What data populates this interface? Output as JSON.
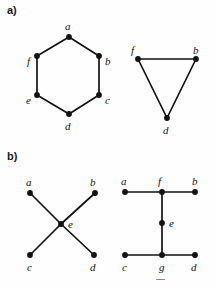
{
  "figure": {
    "background_color": "#fefefe",
    "ink_color": "#121212",
    "parts": [
      {
        "id": "part-a",
        "label": "a)",
        "x": 7,
        "y": 5
      },
      {
        "id": "part-b",
        "label": "b)",
        "x": 7,
        "y": 151
      }
    ],
    "stray_mark": {
      "x": 156,
      "y": 279,
      "width": 9,
      "height": 1
    }
  },
  "graphs": [
    {
      "id": "hexagon",
      "name": "cycle-graph-c6",
      "part": "a)",
      "shape": "hexagon",
      "vertices": [
        {
          "id": "a",
          "label": "a",
          "x": 69,
          "y": 37,
          "label_x": 65,
          "label_y": 21
        },
        {
          "id": "b",
          "label": "b",
          "x": 99,
          "y": 56,
          "label_x": 105,
          "label_y": 56
        },
        {
          "id": "c",
          "label": "c",
          "x": 99,
          "y": 95,
          "label_x": 105,
          "label_y": 95
        },
        {
          "id": "d",
          "label": "d",
          "x": 69,
          "y": 114,
          "label_x": 65,
          "label_y": 121
        },
        {
          "id": "e",
          "label": "e",
          "x": 37,
          "y": 95,
          "label_x": 26,
          "label_y": 95
        },
        {
          "id": "f",
          "label": "f",
          "x": 37,
          "y": 56,
          "label_x": 27,
          "label_y": 56
        }
      ],
      "edges": [
        [
          "a",
          "b"
        ],
        [
          "b",
          "c"
        ],
        [
          "c",
          "d"
        ],
        [
          "d",
          "e"
        ],
        [
          "e",
          "f"
        ],
        [
          "f",
          "a"
        ]
      ]
    },
    {
      "id": "triangle",
      "name": "triangle-graph-k3",
      "part": "a)",
      "shape": "triangle",
      "vertices": [
        {
          "id": "f",
          "label": "f",
          "x": 138,
          "y": 59,
          "label_x": 131,
          "label_y": 45
        },
        {
          "id": "b",
          "label": "b",
          "x": 196,
          "y": 59,
          "label_x": 193,
          "label_y": 45
        },
        {
          "id": "d",
          "label": "d",
          "x": 167,
          "y": 118,
          "label_x": 163,
          "label_y": 125
        }
      ],
      "edges": [
        [
          "f",
          "b"
        ],
        [
          "b",
          "d"
        ],
        [
          "d",
          "f"
        ]
      ]
    },
    {
      "id": "star",
      "name": "star-graph-x",
      "part": "b)",
      "shape": "x-star",
      "vertices": [
        {
          "id": "a",
          "label": "a",
          "x": 30,
          "y": 193,
          "label_x": 26,
          "label_y": 177
        },
        {
          "id": "b",
          "label": "b",
          "x": 95,
          "y": 193,
          "label_x": 90,
          "label_y": 177
        },
        {
          "id": "e",
          "label": "e",
          "x": 61,
          "y": 224,
          "label_x": 68,
          "label_y": 219
        },
        {
          "id": "c",
          "label": "c",
          "x": 30,
          "y": 255,
          "label_x": 27,
          "label_y": 262
        },
        {
          "id": "d",
          "label": "d",
          "x": 94,
          "y": 255,
          "label_x": 90,
          "label_y": 262
        }
      ],
      "edges": [
        [
          "a",
          "e"
        ],
        [
          "b",
          "e"
        ],
        [
          "c",
          "e"
        ],
        [
          "d",
          "e"
        ]
      ]
    },
    {
      "id": "tree",
      "name": "tree-graph-h",
      "part": "b)",
      "shape": "h-tree",
      "vertices": [
        {
          "id": "a",
          "label": "a",
          "x": 125,
          "y": 192,
          "label_x": 121,
          "label_y": 176
        },
        {
          "id": "f",
          "label": "f",
          "x": 162,
          "y": 192,
          "label_x": 158,
          "label_y": 176
        },
        {
          "id": "b",
          "label": "b",
          "x": 195,
          "y": 192,
          "label_x": 192,
          "label_y": 176
        },
        {
          "id": "e",
          "label": "e",
          "x": 162,
          "y": 223,
          "label_x": 169,
          "label_y": 218
        },
        {
          "id": "c",
          "label": "c",
          "x": 125,
          "y": 255,
          "label_x": 122,
          "label_y": 262
        },
        {
          "id": "g",
          "label": "g",
          "x": 162,
          "y": 255,
          "label_x": 159,
          "label_y": 262
        },
        {
          "id": "d",
          "label": "d",
          "x": 195,
          "y": 255,
          "label_x": 191,
          "label_y": 262
        }
      ],
      "edges": [
        [
          "a",
          "f"
        ],
        [
          "f",
          "b"
        ],
        [
          "f",
          "e"
        ],
        [
          "e",
          "g"
        ],
        [
          "c",
          "g"
        ],
        [
          "g",
          "d"
        ]
      ]
    }
  ]
}
